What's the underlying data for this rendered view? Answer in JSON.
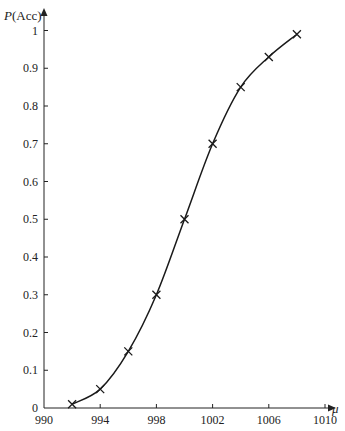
{
  "chart_data": {
    "type": "line",
    "title": "",
    "xlabel": "μ",
    "ylabel": "P(Acc)",
    "ylabel_italic_part": "P",
    "ylabel_rest": "(Acc)",
    "x_ticks": [
      990,
      994,
      998,
      1002,
      1006,
      1010
    ],
    "y_ticks": [
      0,
      0.1,
      0.2,
      0.3,
      0.4,
      0.5,
      0.6,
      0.7,
      0.8,
      0.9,
      1
    ],
    "y_tick_labels": [
      "0",
      "0.1",
      "0.2",
      "0.3",
      "0.4",
      "0.5",
      "0.6",
      "0.7",
      "0.8",
      "0.9",
      "1"
    ],
    "xlim": [
      990,
      1011
    ],
    "ylim": [
      0,
      1.02
    ],
    "grid": false,
    "legend": null,
    "marker": "x",
    "series": [
      {
        "name": "P(Acc)",
        "x": [
          992,
          994,
          996,
          998,
          1000,
          1002,
          1004,
          1006,
          1008
        ],
        "values": [
          0.01,
          0.05,
          0.15,
          0.3,
          0.5,
          0.7,
          0.85,
          0.93,
          0.99
        ]
      }
    ]
  },
  "colors": {
    "line": "#1a1a1a",
    "axis": "#222222",
    "background": "#ffffff"
  }
}
